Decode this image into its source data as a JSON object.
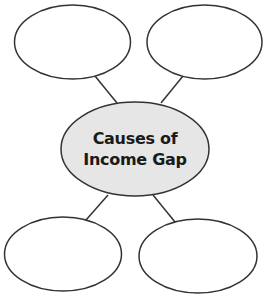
{
  "diagram": {
    "type": "web-organizer",
    "center": {
      "line1": "Causes of",
      "line2": "Income Gap",
      "fill": "#e6e6e6"
    },
    "nodes": [
      {
        "position": "top-left",
        "text": ""
      },
      {
        "position": "top-right",
        "text": ""
      },
      {
        "position": "bottom-left",
        "text": ""
      },
      {
        "position": "bottom-right",
        "text": ""
      }
    ],
    "stroke_color": "#333333"
  }
}
